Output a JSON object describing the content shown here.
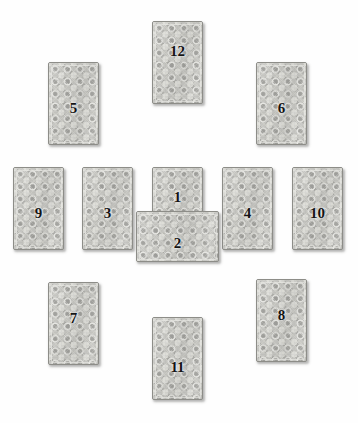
{
  "spread": {
    "title": "Tarot Card Spread Layout",
    "card_back_base_color": "#a9a9a5",
    "card_back_motif_color": "#e2e2dd",
    "card_border_color": "#8d8d88",
    "number_color": "#141414",
    "background_color": "#ffffff",
    "card_width": 51,
    "card_height": 83,
    "total_cards": 12,
    "cards": [
      {
        "number": "1",
        "orientation": "upright",
        "x": 152,
        "y": 167,
        "w": 51,
        "h": 83,
        "num_x": 0,
        "num_y": 22
      },
      {
        "number": "2",
        "orientation": "crossing",
        "x": 136,
        "y": 211,
        "w": 83,
        "h": 51,
        "num_x": 0,
        "num_y": 24
      },
      {
        "number": "3",
        "orientation": "upright",
        "x": 82,
        "y": 167,
        "w": 51,
        "h": 83,
        "num_x": 0,
        "num_y": 38
      },
      {
        "number": "4",
        "orientation": "upright",
        "x": 222,
        "y": 167,
        "w": 51,
        "h": 83,
        "num_x": 0,
        "num_y": 38
      },
      {
        "number": "5",
        "orientation": "upright",
        "x": 48,
        "y": 62,
        "w": 51,
        "h": 83,
        "num_x": 0,
        "num_y": 38
      },
      {
        "number": "6",
        "orientation": "upright",
        "x": 256,
        "y": 62,
        "w": 51,
        "h": 83,
        "num_x": 0,
        "num_y": 38
      },
      {
        "number": "7",
        "orientation": "upright",
        "x": 48,
        "y": 282,
        "w": 51,
        "h": 83,
        "num_x": 0,
        "num_y": 28
      },
      {
        "number": "8",
        "orientation": "upright",
        "x": 256,
        "y": 279,
        "w": 51,
        "h": 83,
        "num_x": 0,
        "num_y": 28
      },
      {
        "number": "9",
        "orientation": "upright",
        "x": 13,
        "y": 167,
        "w": 51,
        "h": 83,
        "num_x": 0,
        "num_y": 38
      },
      {
        "number": "10",
        "orientation": "upright",
        "x": 292,
        "y": 167,
        "w": 51,
        "h": 83,
        "num_x": 0,
        "num_y": 38
      },
      {
        "number": "11",
        "orientation": "upright",
        "x": 152,
        "y": 317,
        "w": 51,
        "h": 83,
        "num_x": 0,
        "num_y": 42
      },
      {
        "number": "12",
        "orientation": "upright",
        "x": 152,
        "y": 21,
        "w": 51,
        "h": 83,
        "num_x": 0,
        "num_y": 22
      }
    ]
  }
}
